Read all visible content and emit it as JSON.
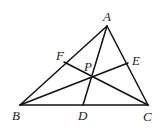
{
  "diagram": {
    "title": "",
    "type": "triangle with concurrent cevians",
    "points": {
      "A": {
        "label": "A",
        "x": 107,
        "y": 26,
        "lx": 103,
        "ly": 21
      },
      "B": {
        "label": "B",
        "x": 20,
        "y": 105,
        "lx": 12,
        "ly": 120
      },
      "C": {
        "label": "C",
        "x": 148,
        "y": 105,
        "lx": 143,
        "ly": 121
      },
      "D": {
        "label": "D",
        "x": 83,
        "y": 105,
        "lx": 78,
        "ly": 120
      },
      "E": {
        "label": "E",
        "x": 128,
        "y": 63,
        "lx": 132,
        "ly": 65
      },
      "F": {
        "label": "F",
        "x": 64,
        "y": 62,
        "lx": 56,
        "ly": 60
      },
      "P": {
        "label": "P",
        "x": 91,
        "y": 77,
        "lx": 84,
        "ly": 71
      }
    },
    "segments": [
      {
        "name": "AB",
        "from": "A",
        "to": "B"
      },
      {
        "name": "BC",
        "from": "B",
        "to": "C"
      },
      {
        "name": "CA",
        "from": "C",
        "to": "A"
      },
      {
        "name": "AD",
        "from": "A",
        "to": "D"
      },
      {
        "name": "BE",
        "from": "B",
        "to": "E"
      },
      {
        "name": "CF",
        "from": "C",
        "to": "F"
      }
    ],
    "colors": {
      "stroke": "#111111",
      "label": "#222222",
      "background": "#ffffff"
    }
  }
}
